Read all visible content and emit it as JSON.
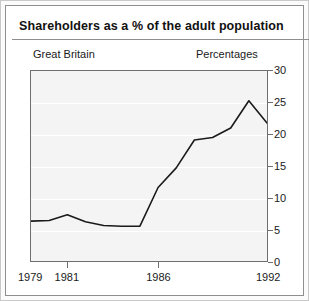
{
  "card": {
    "title": "Shareholders as a % of the adult population"
  },
  "annotations": {
    "region_label": "Great Britain",
    "units_label": "Percentages"
  },
  "axes": {
    "y_ticks": [
      "0",
      "5",
      "10",
      "15",
      "20",
      "25",
      "30"
    ],
    "x_ticks": [
      "1979",
      "1981",
      "1986",
      "1992"
    ]
  },
  "colors": {
    "line": "#1a1a1a",
    "plot_background": "#f4f4f4",
    "gridline": "#ffffff",
    "axis": "#6f6f6f",
    "card_border": "#8e8e8e",
    "text": "#111111"
  },
  "chart_data": {
    "type": "line",
    "title": "Shareholders as a % of the adult population",
    "subtitle": "Great Britain",
    "xlabel": "",
    "ylabel": "Percentages",
    "xlim": [
      1979,
      1992
    ],
    "ylim": [
      0,
      30
    ],
    "grid": true,
    "legend": "none",
    "x": [
      1979,
      1980,
      1981,
      1982,
      1983,
      1984,
      1985,
      1986,
      1987,
      1988,
      1989,
      1990,
      1991,
      1992
    ],
    "values": [
      6.3,
      6.4,
      7.3,
      6.2,
      5.6,
      5.5,
      5.5,
      11.6,
      14.7,
      19.1,
      19.5,
      21.0,
      25.3,
      21.8
    ],
    "x_tick_labels": [
      "1979",
      "1981",
      "1986",
      "1992"
    ],
    "x_tick_values": [
      1979,
      1981,
      1986,
      1992
    ],
    "y_tick_values": [
      0,
      5,
      10,
      15,
      20,
      25,
      30
    ],
    "series": [
      {
        "name": "Shareholders as a % of the adult population",
        "values": [
          6.3,
          6.4,
          7.3,
          6.2,
          5.6,
          5.5,
          5.5,
          11.6,
          14.7,
          19.1,
          19.5,
          21.0,
          25.3,
          21.8
        ]
      }
    ]
  }
}
